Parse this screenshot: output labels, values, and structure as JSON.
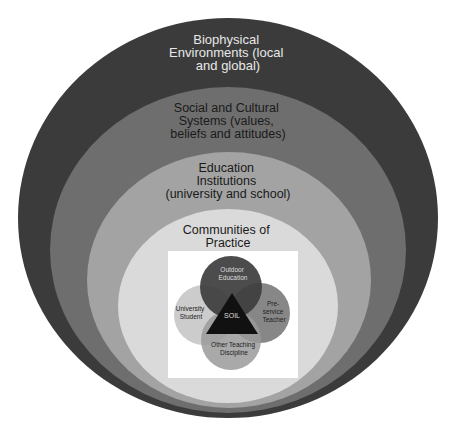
{
  "layers": [
    {
      "id": "biophysical",
      "lines": [
        "Biophysical",
        "Environments (local",
        "and global)"
      ],
      "fill": "#3b3b3b",
      "text_color": "#e8e8e8"
    },
    {
      "id": "social-cultural",
      "lines": [
        "Social and Cultural",
        "Systems (values,",
        "beliefs and attitudes)"
      ],
      "fill": "#6e6e6e",
      "text_color": "#1a1a1a"
    },
    {
      "id": "education-institutions",
      "lines": [
        "Education",
        "Institutions",
        "(university and school)"
      ],
      "fill": "#a3a3a3",
      "text_color": "#1a1a1a"
    },
    {
      "id": "communities-of-practice",
      "lines": [
        "Communities of",
        "Practice"
      ],
      "fill": "#dadada",
      "text_color": "#1a1a1a"
    }
  ],
  "venn": {
    "circles": [
      {
        "id": "outdoor-education",
        "lines": [
          "Outdoor",
          "Education"
        ],
        "fill": "#3d3d3d",
        "text_color": "#dddddd"
      },
      {
        "id": "university-student",
        "lines": [
          "University",
          "Student"
        ],
        "fill": "#c8c8c8",
        "text_color": "#222222"
      },
      {
        "id": "pre-service-teacher",
        "lines": [
          "Pre-",
          "service",
          "Teacher"
        ],
        "fill": "#7a7a7a",
        "text_color": "#222222"
      },
      {
        "id": "other-teaching-discipline",
        "lines": [
          "Other Teaching",
          "Discipline"
        ],
        "fill": "#9a9a9a",
        "text_color": "#222222"
      }
    ],
    "center": {
      "label": "SOIL",
      "fill": "#111111",
      "text_color": "#dddddd"
    }
  }
}
